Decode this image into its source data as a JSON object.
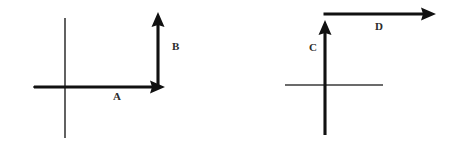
{
  "figure": {
    "background_color": "#ffffff",
    "axis_color": "#3a3a3a",
    "vector_color": "#111111",
    "label_color": "#2b2b2b",
    "width": 450,
    "height": 147
  },
  "diagrams": [
    {
      "id": "left",
      "name": "left-axes-diagram",
      "origin": {
        "x": 65,
        "y": 87
      },
      "axes": {
        "horizontal": {
          "x1": 33,
          "y1": 87,
          "x2": 163,
          "y2": 87
        },
        "vertical": {
          "x1": 65,
          "y1": 18,
          "x2": 65,
          "y2": 138
        }
      },
      "vectors": [
        {
          "label": "A",
          "name": "vector-a",
          "direction": "right",
          "tail": {
            "x": 34,
            "y": 87
          },
          "tip": {
            "x": 165,
            "y": 87
          },
          "label_pos": {
            "x": 113,
            "y": 91
          }
        },
        {
          "label": "B",
          "name": "vector-b",
          "direction": "up",
          "tail": {
            "x": 158,
            "y": 88
          },
          "tip": {
            "x": 158,
            "y": 12
          },
          "label_pos": {
            "x": 172,
            "y": 41
          }
        }
      ]
    },
    {
      "id": "right",
      "name": "right-axes-diagram",
      "origin": {
        "x": 325,
        "y": 85
      },
      "axes": {
        "horizontal": {
          "x1": 285,
          "y1": 85,
          "x2": 383,
          "y2": 85
        },
        "vertical": {
          "x1": 325,
          "y1": 22,
          "x2": 325,
          "y2": 135
        }
      },
      "vectors": [
        {
          "label": "C",
          "name": "vector-c",
          "direction": "up",
          "tail": {
            "x": 325,
            "y": 135
          },
          "tip": {
            "x": 325,
            "y": 20
          },
          "label_pos": {
            "x": 309,
            "y": 42
          }
        },
        {
          "label": "D",
          "name": "vector-d",
          "direction": "right",
          "tail": {
            "x": 324,
            "y": 14
          },
          "tip": {
            "x": 436,
            "y": 14
          },
          "label_pos": {
            "x": 375,
            "y": 21
          }
        }
      ]
    }
  ],
  "labels": {
    "a": "A",
    "b": "B",
    "c": "C",
    "d": "D"
  }
}
